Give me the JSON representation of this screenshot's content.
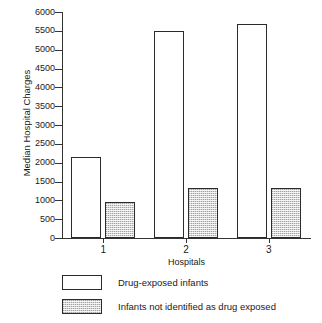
{
  "chart_data": {
    "type": "bar",
    "title": "",
    "xlabel": "Hospitals",
    "ylabel": "Median Hospital Charges",
    "categories": [
      "1",
      "2",
      "3"
    ],
    "series": [
      {
        "name": "Drug-exposed infants",
        "values": [
          2150,
          5500,
          5680
        ],
        "fill": "white"
      },
      {
        "name": "Infants not identified as drug exposed",
        "values": [
          950,
          1340,
          1340
        ],
        "fill": "stipple"
      }
    ],
    "ylim": [
      0,
      6000
    ],
    "yticks": [
      0,
      500,
      1000,
      1500,
      2000,
      2500,
      3000,
      3500,
      4000,
      4500,
      5000,
      5500,
      6000
    ],
    "ytick_labels": [
      "0",
      "500",
      "1000",
      "1500",
      "2000",
      "2500",
      "3000",
      "3500",
      "4000",
      "4500",
      "5000",
      "5500",
      "6000"
    ],
    "grid": false,
    "legend_position": "below"
  },
  "legend": {
    "items": [
      {
        "label": "Drug-exposed infants",
        "swatch": "open-rect-swatch"
      },
      {
        "label": "Infants not identified as drug exposed",
        "swatch": "stippled-rect-swatch"
      }
    ]
  },
  "colors": {
    "axis": "#333333",
    "bar_outline": "#2b2b2b",
    "bar_open_fill": "#ffffff",
    "bar_stipple_fill": "#d7d7d7",
    "background": "#ffffff",
    "text": "#1a1a1a"
  }
}
